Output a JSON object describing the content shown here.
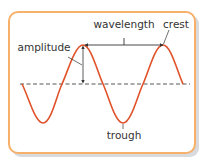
{
  "diagram": {
    "labels": {
      "wavelength": "wavelength",
      "crest": "crest",
      "amplitude": "amplitude",
      "trough": "trough"
    },
    "colors": {
      "wave": "#e0522a",
      "border": "#f6b06a",
      "shadow": "#d8dade",
      "annotation": "#333333",
      "baseline": "#444444"
    }
  }
}
